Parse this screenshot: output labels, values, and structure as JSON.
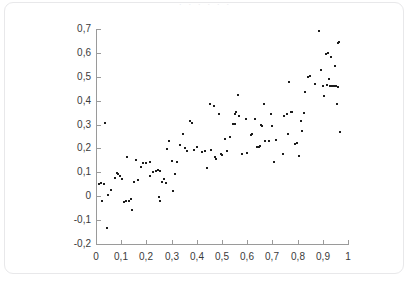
{
  "card": {
    "title_strip": "· · · · · ·"
  },
  "chart_data": {
    "type": "scatter",
    "title": "",
    "subtitle": "",
    "xlabel": "",
    "ylabel": "",
    "xlim": [
      0,
      1
    ],
    "ylim": [
      -0.2,
      0.7
    ],
    "grid": false,
    "legend": null,
    "decimal_separator": ",",
    "marker": {
      "shape": "square",
      "color": "#1c1c1c",
      "size_px": 2
    },
    "x_ticks": [
      0,
      0.1,
      0.2,
      0.3,
      0.4,
      0.5,
      0.6,
      0.7,
      0.8,
      0.9,
      1
    ],
    "x_tick_labels": [
      "0",
      "0,1",
      "0,2",
      "0,3",
      "0,4",
      "0,5",
      "0,6",
      "0,7",
      "0,8",
      "0,9",
      "1"
    ],
    "y_ticks": [
      -0.2,
      -0.1,
      0,
      0.1,
      0.2,
      0.3,
      0.4,
      0.5,
      0.6,
      0.7
    ],
    "y_tick_labels": [
      "-0,2",
      "-0,1",
      "0",
      "0,1",
      "0,2",
      "0,3",
      "0,4",
      "0,5",
      "0,6",
      "0,7"
    ],
    "n_points": 120,
    "points": [
      [
        0.012,
        0.05
      ],
      [
        0.02,
        0.055
      ],
      [
        0.022,
        -0.018
      ],
      [
        0.035,
        0.308
      ],
      [
        0.042,
        -0.135
      ],
      [
        0.048,
        0.005
      ],
      [
        0.058,
        0.028
      ],
      [
        0.075,
        0.078
      ],
      [
        0.082,
        0.096
      ],
      [
        0.095,
        0.086
      ],
      [
        0.103,
        0.072
      ],
      [
        0.112,
        -0.026
      ],
      [
        0.118,
        -0.022
      ],
      [
        0.122,
        0.166
      ],
      [
        0.13,
        -0.02
      ],
      [
        0.138,
        -0.012
      ],
      [
        0.142,
        -0.057
      ],
      [
        0.152,
        0.058
      ],
      [
        0.16,
        0.15
      ],
      [
        0.168,
        0.066
      ],
      [
        0.178,
        0.122
      ],
      [
        0.188,
        0.14
      ],
      [
        0.198,
        0.14
      ],
      [
        0.215,
        0.086
      ],
      [
        0.228,
        0.1
      ],
      [
        0.238,
        0.104
      ],
      [
        0.245,
        0.11
      ],
      [
        0.25,
        -0.005
      ],
      [
        0.252,
        -0.022
      ],
      [
        0.255,
        0.106
      ],
      [
        0.262,
        0.06
      ],
      [
        0.27,
        0.072
      ],
      [
        0.278,
        0.056
      ],
      [
        0.282,
        0.196
      ],
      [
        0.288,
        0.232
      ],
      [
        0.3,
        0.146
      ],
      [
        0.305,
        0.022
      ],
      [
        0.312,
        0.094
      ],
      [
        0.322,
        0.142
      ],
      [
        0.335,
        0.215
      ],
      [
        0.345,
        0.26
      ],
      [
        0.36,
        0.19
      ],
      [
        0.372,
        0.316
      ],
      [
        0.382,
        0.306
      ],
      [
        0.39,
        0.192
      ],
      [
        0.4,
        0.204
      ],
      [
        0.42,
        0.186
      ],
      [
        0.44,
        0.12
      ],
      [
        0.452,
        0.388
      ],
      [
        0.458,
        0.192
      ],
      [
        0.468,
        0.376
      ],
      [
        0.472,
        0.164
      ],
      [
        0.478,
        0.156
      ],
      [
        0.488,
        0.346
      ],
      [
        0.495,
        0.176
      ],
      [
        0.5,
        0.172
      ],
      [
        0.512,
        0.24
      ],
      [
        0.52,
        0.19
      ],
      [
        0.545,
        0.302
      ],
      [
        0.55,
        0.304
      ],
      [
        0.552,
        0.346
      ],
      [
        0.556,
        0.352
      ],
      [
        0.562,
        0.424
      ],
      [
        0.566,
        0.336
      ],
      [
        0.578,
        0.176
      ],
      [
        0.595,
        0.322
      ],
      [
        0.6,
        0.182
      ],
      [
        0.615,
        0.258
      ],
      [
        0.63,
        0.322
      ],
      [
        0.64,
        0.206
      ],
      [
        0.646,
        0.208
      ],
      [
        0.65,
        0.212
      ],
      [
        0.656,
        0.3
      ],
      [
        0.66,
        0.294
      ],
      [
        0.668,
        0.388
      ],
      [
        0.672,
        0.232
      ],
      [
        0.686,
        0.232
      ],
      [
        0.694,
        0.344
      ],
      [
        0.7,
        0.296
      ],
      [
        0.706,
        0.142
      ],
      [
        0.714,
        0.234
      ],
      [
        0.742,
        0.178
      ],
      [
        0.748,
        0.336
      ],
      [
        0.756,
        0.346
      ],
      [
        0.76,
        0.26
      ],
      [
        0.766,
        0.48
      ],
      [
        0.772,
        0.352
      ],
      [
        0.778,
        0.354
      ],
      [
        0.79,
        0.22
      ],
      [
        0.798,
        0.222
      ],
      [
        0.804,
        0.17
      ],
      [
        0.812,
        0.314
      ],
      [
        0.818,
        0.274
      ],
      [
        0.83,
        0.436
      ],
      [
        0.842,
        0.5
      ],
      [
        0.848,
        0.502
      ],
      [
        0.868,
        0.47
      ],
      [
        0.886,
        0.692
      ],
      [
        0.892,
        0.528
      ],
      [
        0.9,
        0.462
      ],
      [
        0.905,
        0.42
      ],
      [
        0.912,
        0.596
      ],
      [
        0.916,
        0.466
      ],
      [
        0.922,
        0.6
      ],
      [
        0.926,
        0.49
      ],
      [
        0.93,
        0.46
      ],
      [
        0.934,
        0.582
      ],
      [
        0.938,
        0.462
      ],
      [
        0.944,
        0.46
      ],
      [
        0.948,
        0.544
      ],
      [
        0.952,
        0.462
      ],
      [
        0.956,
        0.388
      ],
      [
        0.96,
        0.456
      ],
      [
        0.962,
        0.642
      ],
      [
        0.966,
        0.646
      ],
      [
        0.968,
        0.268
      ],
      [
        0.03,
        0.052
      ],
      [
        0.088,
        0.092
      ],
      [
        0.215,
        0.142
      ],
      [
        0.352,
        0.2
      ],
      [
        0.432,
        0.19
      ],
      [
        0.53,
        0.246
      ],
      [
        0.618,
        0.262
      ],
      [
        0.824,
        0.348
      ]
    ]
  }
}
